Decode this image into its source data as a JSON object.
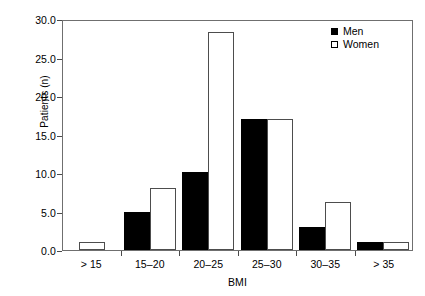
{
  "chart_data": {
    "type": "bar",
    "title": "",
    "xlabel": "BMI",
    "ylabel": "Patients (n)",
    "categories": [
      "> 15",
      "15–20",
      "20–25",
      "25–30",
      "30–35",
      "> 35"
    ],
    "series": [
      {
        "name": "Men",
        "color": "#000000",
        "fill": "solid",
        "values": [
          0,
          5.0,
          10.1,
          17.0,
          3.0,
          1.0
        ]
      },
      {
        "name": "Women",
        "color": "#ffffff",
        "fill": "open",
        "values": [
          1.1,
          8.1,
          28.3,
          17.0,
          6.3,
          1.0
        ]
      }
    ],
    "ylim": [
      0,
      30
    ],
    "yticks": [
      0.0,
      5.0,
      10.0,
      15.0,
      20.0,
      25.0,
      30.0
    ],
    "ytick_labels": [
      "0.0",
      "5.0",
      "10.0",
      "15.0",
      "20.0",
      "25.0",
      "30.0"
    ],
    "grid": false,
    "legend_position": "top-right",
    "legend": [
      "Men",
      "Women"
    ]
  }
}
